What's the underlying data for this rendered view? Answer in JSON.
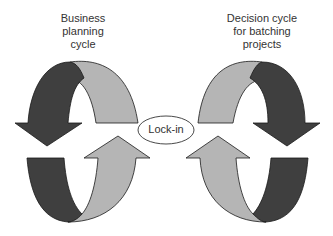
{
  "labels": {
    "left_cycle": "Business\nplanning\ncycle",
    "right_cycle": "Decision cycle\nfor batching\nprojects",
    "center": "Lock-in"
  },
  "colors": {
    "dark": "#3f3f3f",
    "light": "#b5b5b5",
    "stroke": "#1a1a1a",
    "text": "#333333",
    "background": "#ffffff"
  }
}
